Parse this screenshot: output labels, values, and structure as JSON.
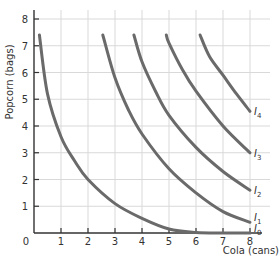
{
  "chart_data": {
    "type": "line",
    "title": "",
    "xlabel": "Cola (cans)",
    "ylabel": "Popcorn (bags)",
    "xlim": [
      0,
      8
    ],
    "ylim": [
      0,
      8
    ],
    "grid": true,
    "x_ticks": [
      "0",
      "1",
      "2",
      "3",
      "4",
      "5",
      "6",
      "7",
      "8"
    ],
    "y_ticks": [
      "1",
      "2",
      "3",
      "4",
      "5",
      "6",
      "7",
      "8"
    ],
    "series": [
      {
        "name": "I0",
        "label_main": "I",
        "label_sub": "0",
        "points": [
          [
            0.2,
            7.4
          ],
          [
            0.5,
            5.2
          ],
          [
            1,
            3.6
          ],
          [
            1.5,
            2.7
          ],
          [
            2,
            2.0
          ],
          [
            3,
            1.1
          ],
          [
            4,
            0.55
          ],
          [
            5,
            0.15
          ],
          [
            6,
            0.02
          ],
          [
            7,
            0.0
          ],
          [
            8,
            0.0
          ]
        ]
      },
      {
        "name": "I1",
        "label_main": "I",
        "label_sub": "1",
        "points": [
          [
            2.55,
            7.4
          ],
          [
            3,
            5.8
          ],
          [
            3.5,
            4.6
          ],
          [
            4,
            3.7
          ],
          [
            5,
            2.4
          ],
          [
            6,
            1.5
          ],
          [
            7,
            0.8
          ],
          [
            8,
            0.4
          ]
        ]
      },
      {
        "name": "I2",
        "label_main": "I",
        "label_sub": "2",
        "points": [
          [
            3.7,
            7.4
          ],
          [
            4,
            6.4
          ],
          [
            4.5,
            5.3
          ],
          [
            5,
            4.4
          ],
          [
            6,
            3.2
          ],
          [
            7,
            2.3
          ],
          [
            8,
            1.6
          ]
        ]
      },
      {
        "name": "I3",
        "label_main": "I",
        "label_sub": "3",
        "points": [
          [
            4.9,
            7.4
          ],
          [
            5,
            7.1
          ],
          [
            5.5,
            6.1
          ],
          [
            6,
            5.3
          ],
          [
            7,
            4.0
          ],
          [
            8,
            3.0
          ]
        ]
      },
      {
        "name": "I4",
        "label_main": "I",
        "label_sub": "4",
        "points": [
          [
            6.15,
            7.4
          ],
          [
            6.5,
            6.6
          ],
          [
            7,
            5.9
          ],
          [
            7.5,
            5.2
          ],
          [
            8,
            4.55
          ]
        ]
      }
    ],
    "legend": "inline labels at right end of each curve"
  },
  "colors": {
    "curve": "#6a6a6a",
    "axis": "#333333",
    "grid": "#d9d9d9",
    "background": "#ffffff"
  }
}
